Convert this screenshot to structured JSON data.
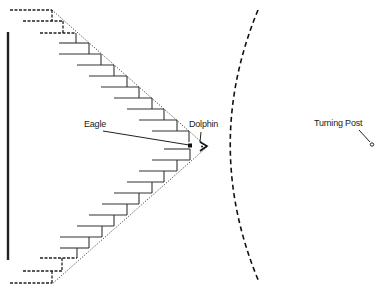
{
  "diagram": {
    "type": "formation-diagram",
    "labels": {
      "eagle": "Eagle",
      "dolphin": "Dolphin",
      "turning_post": "Turning Post"
    },
    "colors": {
      "stroke": "#222222",
      "background": "#ffffff"
    },
    "elements": [
      {
        "name": "wall",
        "style": "solid-thick"
      },
      {
        "name": "v-formation-left-arm",
        "style": "stepped-lines",
        "steps_top": 12,
        "steps_bottom": 12
      },
      {
        "name": "v-formation-outline",
        "style": "dotted"
      },
      {
        "name": "arc",
        "style": "dashed"
      },
      {
        "name": "eagle-marker",
        "shape": "square"
      },
      {
        "name": "dolphin-marker",
        "shape": "chevron"
      },
      {
        "name": "turning-post-marker",
        "shape": "circle"
      }
    ]
  }
}
